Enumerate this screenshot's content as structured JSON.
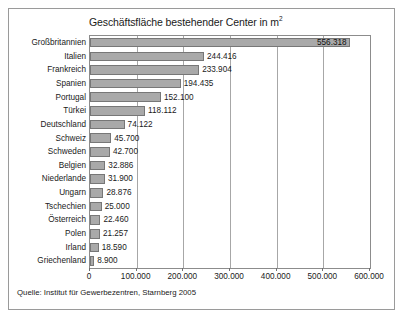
{
  "figure": {
    "title": "Geschäftsfläche bestehender Center in m",
    "title_superscript": "2",
    "source": "Quelle: Institut für Gewerbezentren, Starnberg 2005"
  },
  "chart_data": {
    "type": "bar",
    "orientation": "horizontal",
    "xlabel": "",
    "ylabel": "",
    "xlim": [
      0,
      600000
    ],
    "xticks": [
      0,
      100000,
      200000,
      300000,
      400000,
      500000,
      600000
    ],
    "xtick_labels": [
      "0",
      "100.000",
      "200.000",
      "300.000",
      "400.000",
      "500.000",
      "600.000"
    ],
    "grid": true,
    "grid_axis": "x",
    "legend": false,
    "bar_color": "#a9a9a9",
    "bar_edge_color": "#777777",
    "categories": [
      "Großbritannien",
      "Italien",
      "Frankreich",
      "Spanien",
      "Portugal",
      "Türkei",
      "Deutschland",
      "Schweiz",
      "Schweden",
      "Belgien",
      "Niederlande",
      "Ungarn",
      "Tschechien",
      "Österreich",
      "Polen",
      "Irland",
      "Griechenland"
    ],
    "values": [
      556318,
      244416,
      233904,
      194435,
      152100,
      118112,
      74122,
      45700,
      42700,
      32886,
      31900,
      28876,
      25000,
      22460,
      21257,
      18590,
      8900
    ],
    "value_labels": [
      "556.318",
      "244.416",
      "233.904",
      "194.435",
      "152.100",
      "118.112",
      "74.122",
      "45.700",
      "42.700",
      "32.886",
      "31.900",
      "28.876",
      "25.000",
      "22.460",
      "21.257",
      "18.590",
      "8.900"
    ],
    "label_placement": [
      "inside",
      "outside",
      "outside",
      "outside",
      "outside",
      "outside",
      "outside",
      "outside",
      "outside",
      "outside",
      "outside",
      "outside",
      "outside",
      "outside",
      "outside",
      "outside",
      "outside"
    ]
  }
}
